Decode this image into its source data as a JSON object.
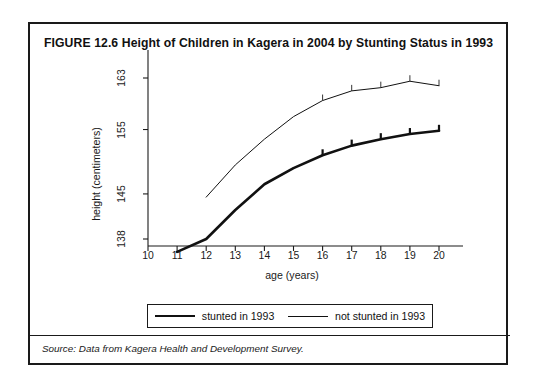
{
  "figure": {
    "title": "FIGURE 12.6  Height of Children in Kagera in 2004 by Stunting Status in 1993",
    "source_note": "Source: Data from Kagera Health and Development Survey."
  },
  "chart_data": {
    "type": "line",
    "title": "FIGURE 12.6  Height of Children in Kagera in 2004 by Stunting Status in 1993",
    "xlabel": "age (years)",
    "ylabel": "height (centimeters)",
    "xlim": [
      10,
      20
    ],
    "ylim": [
      134,
      165
    ],
    "grid": false,
    "legend_position": "below-axes",
    "x_ticks": [
      10,
      11,
      12,
      13,
      14,
      15,
      16,
      17,
      18,
      19,
      20
    ],
    "y_ticks": [
      138,
      145,
      155,
      163
    ],
    "series": [
      {
        "name": "stunted in 1993",
        "line_style": "thick",
        "color": "#111111",
        "x": [
          11,
          12,
          13,
          14,
          15,
          16,
          17,
          18,
          19,
          20
        ],
        "values": [
          136.0,
          138.0,
          142.5,
          146.5,
          149.0,
          151.0,
          152.5,
          153.5,
          154.3,
          154.8
        ]
      },
      {
        "name": "not stunted in 1993",
        "line_style": "thin",
        "color": "#111111",
        "x": [
          12,
          13,
          14,
          15,
          16,
          17,
          18,
          19,
          20
        ],
        "values": [
          144.5,
          149.5,
          153.5,
          157.0,
          159.5,
          161.0,
          161.5,
          162.5,
          161.8
        ]
      }
    ]
  },
  "legend": {
    "entries": [
      {
        "label": "stunted in 1993"
      },
      {
        "label": "not stunted in 1993"
      }
    ]
  }
}
